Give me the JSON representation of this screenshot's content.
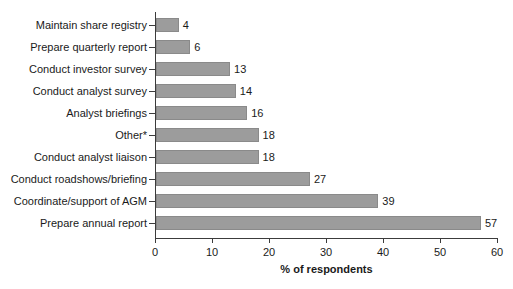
{
  "chart_data": {
    "type": "bar",
    "orientation": "horizontal",
    "title": "",
    "xlabel": "% of respondents",
    "ylabel": "",
    "xlim": [
      0,
      60
    ],
    "xticks": [
      0,
      10,
      20,
      30,
      40,
      50,
      60
    ],
    "grid": false,
    "legend": null,
    "bar_color": "#9c9c9c",
    "bar_edge_color": "#8a8a8a",
    "axis_color": "#3c3c3c",
    "background": "#ffffff",
    "show_value_labels": true,
    "categories": [
      "Maintain share registry",
      "Prepare quarterly report",
      "Conduct investor survey",
      "Conduct analyst survey",
      "Analyst briefings",
      "Other*",
      "Conduct analyst liaison",
      "Conduct roadshows/briefing",
      "Coordinate/support of AGM",
      "Prepare annual report"
    ],
    "values": [
      4,
      6,
      13,
      14,
      16,
      18,
      18,
      27,
      39,
      57
    ]
  }
}
